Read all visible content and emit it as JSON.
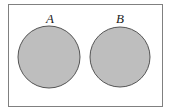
{
  "diagram": {
    "type": "venn-disjoint",
    "universe": {
      "stroke": "#777777",
      "fill": "#ffffff"
    },
    "sets": [
      {
        "label": "A",
        "fill": "#bdbdbd",
        "stroke": "#555555"
      },
      {
        "label": "B",
        "fill": "#bdbdbd",
        "stroke": "#555555"
      }
    ]
  }
}
